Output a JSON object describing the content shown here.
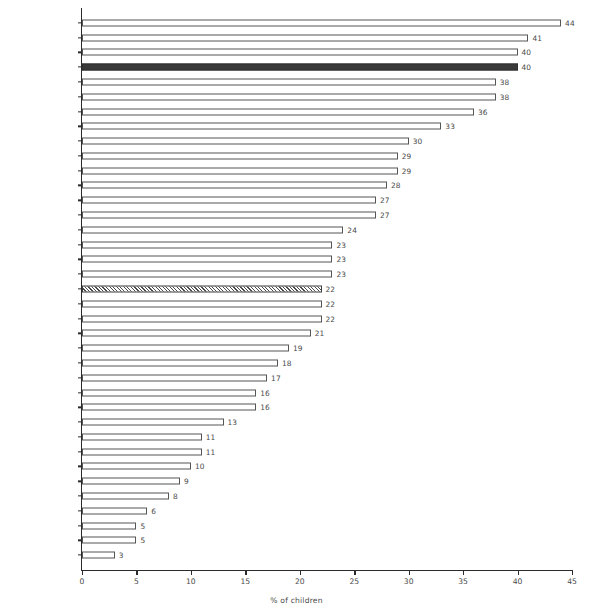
{
  "chart_data": {
    "type": "bar",
    "orientation": "horizontal",
    "title": "",
    "xlabel": "% of children",
    "ylabel": "",
    "xlim": [
      0,
      45
    ],
    "xticks": [
      0,
      5,
      10,
      15,
      20,
      25,
      30,
      35,
      40,
      45
    ],
    "grid": false,
    "legend": false,
    "categories": [
      "Czech Republic",
      "Switzerland",
      "Isle of Man",
      "Ireland",
      "United Kingdom",
      "France",
      "Spain",
      "Belgium",
      "Germany",
      "Slovenia",
      "Netherlands",
      "Italy",
      "Slovak Rep.",
      "Greenland",
      "Estonia",
      "Denmark",
      "Croatia",
      "Austria",
      "ESPAD average",
      "Russia",
      "Bulgaria",
      "Ukraine",
      "Poland",
      "Portugal",
      "Latvia",
      "Lithuania",
      "Hungary",
      "Iceland",
      "Malta",
      "Finland",
      "Faroe Islands",
      "Norway",
      "Sweden",
      "Greece",
      "Turkey",
      "Cyprus",
      "Romania"
    ],
    "values": [
      44,
      41,
      40,
      40,
      38,
      38,
      36,
      33,
      30,
      29,
      29,
      28,
      27,
      27,
      24,
      23,
      23,
      23,
      22,
      22,
      22,
      21,
      19,
      18,
      17,
      16,
      16,
      13,
      11,
      11,
      10,
      9,
      8,
      6,
      5,
      5,
      3
    ],
    "bar_styles": [
      "open",
      "open",
      "open",
      "highlight",
      "open",
      "open",
      "open",
      "open",
      "open",
      "open",
      "open",
      "open",
      "open",
      "open",
      "open",
      "open",
      "open",
      "open",
      "hatch",
      "open",
      "open",
      "open",
      "open",
      "open",
      "open",
      "open",
      "open",
      "open",
      "open",
      "open",
      "open",
      "open",
      "open",
      "open",
      "open",
      "open",
      "open"
    ],
    "colors": {
      "bar_fill": "#ffffff",
      "bar_edge": "#555555",
      "highlight_fill": "#3a3a3a",
      "hatch_edge": "#3d3d3d",
      "axis": "#2b2b2b",
      "text": "#4a4a4a",
      "background": "#ffffff"
    }
  }
}
